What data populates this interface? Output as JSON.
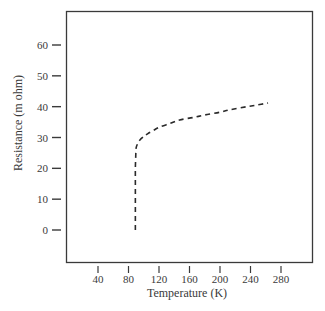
{
  "chart_data": {
    "type": "line",
    "title": "",
    "xlabel": "Temperature (K)",
    "ylabel": "Resistance (m ohm)",
    "xlim": [
      0,
      320
    ],
    "ylim": [
      -10,
      70
    ],
    "x_ticks": [
      40,
      80,
      120,
      160,
      200,
      240,
      280
    ],
    "y_ticks": [
      0,
      10,
      20,
      30,
      40,
      50,
      60
    ],
    "grid": false,
    "legend": null,
    "series": [
      {
        "name": "Resistance",
        "line_style": "dashed",
        "color": "#2a2a2a",
        "x": [
          89,
          89,
          89,
          89,
          89,
          89.5,
          90,
          92,
          95,
          100,
          105,
          112,
          121,
          135,
          147,
          165,
          180,
          200,
          213,
          235,
          250,
          263
        ],
        "y": [
          0,
          5,
          10,
          15,
          20,
          24,
          26.6,
          28,
          29.2,
          30.3,
          31.2,
          32.2,
          33.4,
          34.6,
          35.7,
          36.5,
          37.3,
          38.2,
          39,
          40,
          40.6,
          41.2
        ]
      }
    ]
  },
  "colors": {
    "axis": "#3a3a3a",
    "curve": "#2a2a2a",
    "background": "#ffffff"
  }
}
